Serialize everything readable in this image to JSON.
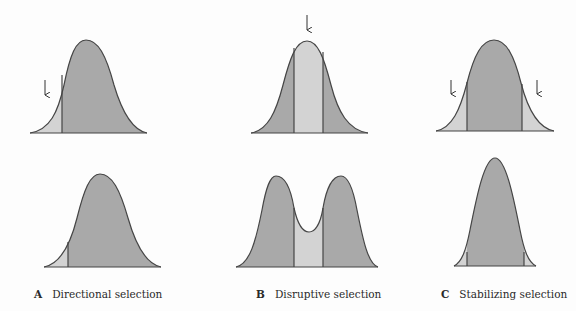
{
  "colors": {
    "selected_fill": "#a9a9a9",
    "eliminated_fill": "#d3d3d3",
    "outline": "#454545",
    "background": "#fdfdfd"
  },
  "panels": [
    {
      "letter": "A",
      "caption": "Directional selection",
      "before": {
        "shape": "bell",
        "cut_lines": 1,
        "arrows": 1,
        "arrow_position": "left tail"
      },
      "after": {
        "shape": "bell shifted right",
        "cut_lines": 1
      }
    },
    {
      "letter": "B",
      "caption": "Disruptive selection",
      "before": {
        "shape": "bell",
        "cut_lines": 2,
        "arrows": 1,
        "arrow_position": "center peak"
      },
      "after": {
        "shape": "bimodal",
        "cut_lines": 2
      }
    },
    {
      "letter": "C",
      "caption": "Stabilizing selection",
      "before": {
        "shape": "bell",
        "cut_lines": 2,
        "arrows": 2,
        "arrow_position": "both tails"
      },
      "after": {
        "shape": "narrow bell",
        "cut_lines": 2
      }
    }
  ]
}
